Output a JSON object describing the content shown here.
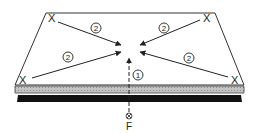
{
  "diagram": {
    "corner_marker": "X",
    "step_labels": {
      "step1": "1",
      "step2": "2"
    },
    "force_symbol": "⊗",
    "force_label": "F",
    "colors": {
      "stroke": "#222222",
      "plate_fill": "#ffffff",
      "band_gray": "#b8b8b8",
      "band_black": "#111111"
    }
  }
}
